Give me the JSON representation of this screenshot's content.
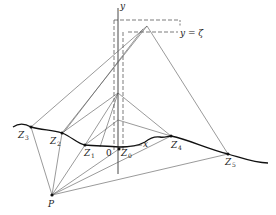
{
  "figure": {
    "labels": {
      "y_axis": "y",
      "x_axis": "x",
      "origin": "0",
      "P": "P",
      "Z_letter": "Z",
      "Z3_sub": "3",
      "Z2_sub": "2",
      "Z1_sub": "1",
      "Z0_sub": "0",
      "Z4_sub": "4",
      "Z5_sub": "5",
      "level_label": "y = ζ"
    },
    "colors": {
      "line": "#555555",
      "curve": "#111111",
      "text": "#222222"
    }
  }
}
